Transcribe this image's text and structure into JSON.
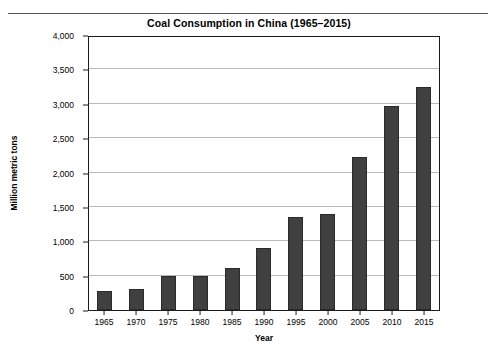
{
  "chart_data": {
    "type": "bar",
    "title": "Coal Consumption in China (1965–2015)",
    "xlabel": "Year",
    "ylabel": "Million metric tons",
    "categories": [
      "1965",
      "1970",
      "1975",
      "1980",
      "1985",
      "1990",
      "1995",
      "2000",
      "2005",
      "2010",
      "2015"
    ],
    "values": [
      275,
      305,
      495,
      500,
      610,
      905,
      1360,
      1400,
      2220,
      2970,
      3250
    ],
    "ylim": [
      0,
      4000
    ],
    "ytick_labels": [
      "0",
      "500",
      "1,000",
      "1,500",
      "2,000",
      "2,500",
      "3,000",
      "3,500",
      "4,000"
    ],
    "ytick_values": [
      0,
      500,
      1000,
      1500,
      2000,
      2500,
      3000,
      3500,
      4000
    ],
    "grid": true,
    "legend": "none",
    "bar_color": "#404040",
    "gridline_color": "#b9b9b9",
    "frame_color": "#1a1a1a"
  }
}
